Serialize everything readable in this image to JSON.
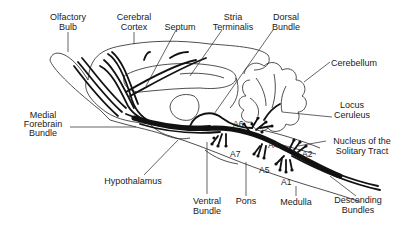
{
  "diagram": {
    "labels": {
      "olfactory_bulb": [
        "Olfactory",
        "Bulb"
      ],
      "cerebral_cortex": [
        "Cerebral",
        "Cortex"
      ],
      "septum": [
        "Septum"
      ],
      "stria_terminalis": [
        "Stria",
        "Terminalis"
      ],
      "dorsal_bundle": [
        "Dorsal",
        "Bundle"
      ],
      "cerebellum": [
        "Cerebellum"
      ],
      "locus_ceruleus": [
        "Locus",
        "Ceruleus"
      ],
      "medial_forebrain_bundle": [
        "Medial",
        "Forebrain",
        "Bundle"
      ],
      "nucleus_solitary_tract": [
        "Nucleus of the",
        "Solitary Tract"
      ],
      "hypothalamus": [
        "Hypothalamus"
      ],
      "ventral_bundle": [
        "Ventral",
        "Bundle"
      ],
      "pons": [
        "Pons"
      ],
      "medulla": [
        "Medulla"
      ],
      "descending_bundles": [
        "Descending",
        "Bundles"
      ]
    },
    "cell_groups": [
      "A1",
      "A2",
      "A4",
      "A5",
      "A6",
      "A7"
    ],
    "colors": {
      "ink": "#111111",
      "background": "#ffffff"
    }
  }
}
